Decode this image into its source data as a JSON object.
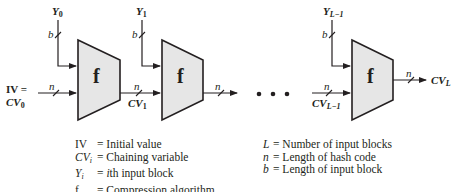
{
  "diagram": {
    "type": "iterated hash function structure",
    "blocks": [
      {
        "label": "f",
        "input_block": "Y",
        "input_sub": "0",
        "input_width": "b",
        "chain_in": "CV",
        "chain_in_sub": "0",
        "chain_width": "n",
        "chain_out": "CV",
        "chain_out_sub": "1"
      },
      {
        "label": "f",
        "input_block": "Y",
        "input_sub": "1",
        "input_width": "b",
        "chain_width": "n",
        "out_width": "n"
      },
      {
        "label": "f",
        "input_block": "Y",
        "input_sub": "L−1",
        "input_width": "b",
        "chain_in": "CV",
        "chain_in_sub": "L−1",
        "chain_width": "n",
        "out_width": "n",
        "chain_out": "CV",
        "chain_out_sub": "L"
      }
    ],
    "iv_label": "IV =",
    "ellipsis": "• • •"
  },
  "legend": {
    "left": [
      {
        "key": "IV",
        "key_sub": "",
        "def": "= Initial value"
      },
      {
        "key": "CV",
        "key_sub": "i",
        "def": "= Chaining variable"
      },
      {
        "key": "Y",
        "key_sub": "i",
        "def": "= ith input block",
        "def_italic_prefix": "i",
        "def_rest": "th input block"
      },
      {
        "key": "f",
        "key_sub": "",
        "def": "= Compression algorithm"
      }
    ],
    "right": [
      {
        "key": "L",
        "def": "= Number of input blocks"
      },
      {
        "key": "n",
        "def": "= Length of hash code"
      },
      {
        "key": "b",
        "def": "= Length of input block"
      }
    ]
  },
  "colors": {
    "block_fill": "#e6e6e6",
    "stroke": "#231f20"
  }
}
